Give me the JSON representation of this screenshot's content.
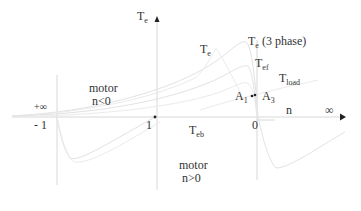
{
  "diagram": {
    "y_axis": {
      "label": "T",
      "label_sub": "e"
    },
    "x_axis": {
      "label": "n",
      "end_label": "∞"
    },
    "ticks": {
      "plus_inf": "+∞",
      "minus_one": "- 1",
      "one": "1",
      "zero": "0"
    },
    "regions": {
      "upper": {
        "line1": "motor",
        "line2": "n<0"
      },
      "lower": {
        "line1": "motor",
        "line2": "n>0"
      }
    },
    "curves": {
      "te": {
        "label": "T",
        "sub": "e"
      },
      "te_3phase": {
        "label": "T",
        "sub": "e",
        "suffix": " (3 phase)"
      },
      "tef": {
        "label": "T",
        "sub": "ef"
      },
      "tload": {
        "label": "T",
        "sub": "load"
      },
      "teb": {
        "label": "T",
        "sub": "eb"
      }
    },
    "points": {
      "a1": {
        "label": "A",
        "sub": "1"
      },
      "a3": {
        "label": "A",
        "sub": "3"
      }
    },
    "colors": {
      "text": "#333333",
      "axis": "#d8d8d8",
      "curve": "#e2e2e2",
      "marker": "#222222"
    }
  }
}
